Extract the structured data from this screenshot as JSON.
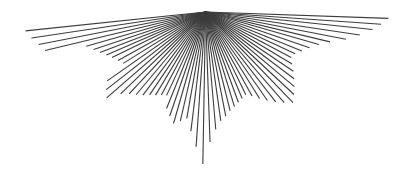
{
  "canvas": {
    "width": 408,
    "height": 173,
    "background_color": "#ffffff"
  },
  "figure": {
    "type": "line-burst",
    "stroke_color": "#3c3c3c",
    "stroke_width": 1.1,
    "apex": {
      "x": 205.5,
      "y": 12.0
    },
    "line_count": 61
  },
  "chart_data": {
    "type": "scatter",
    "title": "",
    "xlabel": "",
    "ylabel": "",
    "xlim": [
      0,
      408
    ],
    "ylim": [
      0,
      173
    ],
    "grid": false,
    "legend": null,
    "apex_x": 205.5,
    "apex_y": 12.0,
    "rays": [
      {
        "angle_deg": 186.0,
        "length": 181.0
      },
      {
        "angle_deg": 188.5,
        "length": 176.0
      },
      {
        "angle_deg": 191.0,
        "length": 170.0
      },
      {
        "angle_deg": 193.5,
        "length": 165.0
      },
      {
        "angle_deg": 196.0,
        "length": 124.0
      },
      {
        "angle_deg": 198.5,
        "length": 118.0
      },
      {
        "angle_deg": 201.0,
        "length": 113.0
      },
      {
        "angle_deg": 203.5,
        "length": 108.0
      },
      {
        "angle_deg": 206.0,
        "length": 104.0
      },
      {
        "angle_deg": 209.0,
        "length": 100.0
      },
      {
        "angle_deg": 212.0,
        "length": 97.0
      },
      {
        "angle_deg": 215.0,
        "length": 120.0
      },
      {
        "angle_deg": 218.0,
        "length": 126.0
      },
      {
        "angle_deg": 221.0,
        "length": 131.0
      },
      {
        "angle_deg": 224.0,
        "length": 118.0
      },
      {
        "angle_deg": 227.0,
        "length": 112.0
      },
      {
        "angle_deg": 230.0,
        "length": 108.0
      },
      {
        "angle_deg": 233.0,
        "length": 104.0
      },
      {
        "angle_deg": 236.0,
        "length": 100.0
      },
      {
        "angle_deg": 239.0,
        "length": 97.0
      },
      {
        "angle_deg": 242.0,
        "length": 94.0
      },
      {
        "angle_deg": 245.0,
        "length": 92.0
      },
      {
        "angle_deg": 248.0,
        "length": 104.0
      },
      {
        "angle_deg": 251.0,
        "length": 110.0
      },
      {
        "angle_deg": 254.0,
        "length": 116.0
      },
      {
        "angle_deg": 257.0,
        "length": 112.0
      },
      {
        "angle_deg": 260.0,
        "length": 108.0
      },
      {
        "angle_deg": 263.0,
        "length": 120.0
      },
      {
        "angle_deg": 266.0,
        "length": 135.0
      },
      {
        "angle_deg": 269.0,
        "length": 152.0
      },
      {
        "angle_deg": 272.0,
        "length": 130.0
      },
      {
        "angle_deg": 275.0,
        "length": 118.0
      },
      {
        "angle_deg": 278.0,
        "length": 110.0
      },
      {
        "angle_deg": 281.0,
        "length": 106.0
      },
      {
        "angle_deg": 284.0,
        "length": 102.0
      },
      {
        "angle_deg": 287.0,
        "length": 99.0
      },
      {
        "angle_deg": 290.0,
        "length": 96.0
      },
      {
        "angle_deg": 293.0,
        "length": 94.0
      },
      {
        "angle_deg": 296.0,
        "length": 92.0
      },
      {
        "angle_deg": 299.0,
        "length": 96.0
      },
      {
        "angle_deg": 302.0,
        "length": 102.0
      },
      {
        "angle_deg": 305.0,
        "length": 108.0
      },
      {
        "angle_deg": 308.0,
        "length": 114.0
      },
      {
        "angle_deg": 311.0,
        "length": 120.0
      },
      {
        "angle_deg": 314.0,
        "length": 126.0
      },
      {
        "angle_deg": 317.0,
        "length": 121.0
      },
      {
        "angle_deg": 320.0,
        "length": 116.0
      },
      {
        "angle_deg": 323.0,
        "length": 111.0
      },
      {
        "angle_deg": 326.0,
        "length": 106.0
      },
      {
        "angle_deg": 329.0,
        "length": 101.0
      },
      {
        "angle_deg": 332.0,
        "length": 97.0
      },
      {
        "angle_deg": 335.0,
        "length": 99.0
      },
      {
        "angle_deg": 338.0,
        "length": 104.0
      },
      {
        "angle_deg": 341.0,
        "length": 110.0
      },
      {
        "angle_deg": 344.0,
        "length": 118.0
      },
      {
        "angle_deg": 346.5,
        "length": 128.0
      },
      {
        "angle_deg": 349.0,
        "length": 143.0
      },
      {
        "angle_deg": 351.5,
        "length": 156.0
      },
      {
        "angle_deg": 354.0,
        "length": 168.0
      },
      {
        "angle_deg": 356.0,
        "length": 176.0
      },
      {
        "angle_deg": 358.0,
        "length": 183.0
      }
    ]
  }
}
